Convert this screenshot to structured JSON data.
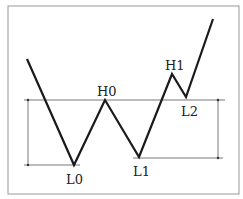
{
  "diagram": {
    "type": "double-bottom price pattern",
    "colors": {
      "background": "#ffffff",
      "frame": "#9a9a9a",
      "price_line": "#1a1a1a",
      "guide_line": "#555555",
      "label": "#222222"
    },
    "price_path": [
      {
        "x": 27,
        "y": 59
      },
      {
        "x": 74,
        "y": 165
      },
      {
        "x": 105,
        "y": 100
      },
      {
        "x": 139,
        "y": 157
      },
      {
        "x": 172,
        "y": 74
      },
      {
        "x": 186,
        "y": 97
      },
      {
        "x": 213,
        "y": 19
      }
    ],
    "labels": {
      "L0": "L0",
      "H0": "H0",
      "L1": "L1",
      "H1": "H1",
      "L2": "L2"
    }
  }
}
